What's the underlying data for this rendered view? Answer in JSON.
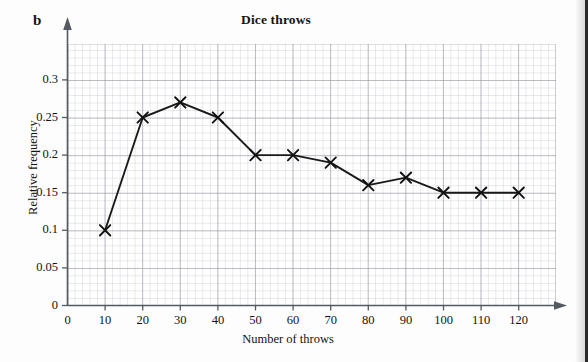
{
  "figure": {
    "part_label": "b",
    "title": "Dice throws"
  },
  "axes": {
    "x_title": "Number of throws",
    "y_title": "Relative frequency",
    "x_ticks": [
      "0",
      "10",
      "20",
      "30",
      "40",
      "50",
      "60",
      "70",
      "80",
      "90",
      "100",
      "110",
      "120"
    ],
    "y_ticks": [
      "0",
      "0.05",
      "0.1",
      "0.15",
      "0.2",
      "0.25",
      "0.3"
    ]
  },
  "chart_data": {
    "type": "line",
    "title": "Dice throws",
    "xlabel": "Number of throws",
    "ylabel": "Relative frequency",
    "x": [
      10,
      20,
      30,
      40,
      50,
      60,
      70,
      80,
      90,
      100,
      110,
      120
    ],
    "values": [
      0.1,
      0.25,
      0.27,
      0.25,
      0.2,
      0.2,
      0.19,
      0.16,
      0.17,
      0.15,
      0.15,
      0.15
    ],
    "series": [
      {
        "name": "Relative frequency",
        "values": [
          0.1,
          0.25,
          0.27,
          0.25,
          0.2,
          0.2,
          0.19,
          0.16,
          0.17,
          0.15,
          0.15,
          0.15
        ]
      }
    ],
    "xlim": [
      0,
      130
    ],
    "ylim": [
      0,
      0.34
    ],
    "x_tick_values": [
      0,
      10,
      20,
      30,
      40,
      50,
      60,
      70,
      80,
      90,
      100,
      110,
      120
    ],
    "y_tick_values": [
      0,
      0.05,
      0.1,
      0.15,
      0.2,
      0.25,
      0.3
    ],
    "grid": true,
    "legend": false,
    "marker": "x",
    "line_color": "#1a1a1a"
  }
}
